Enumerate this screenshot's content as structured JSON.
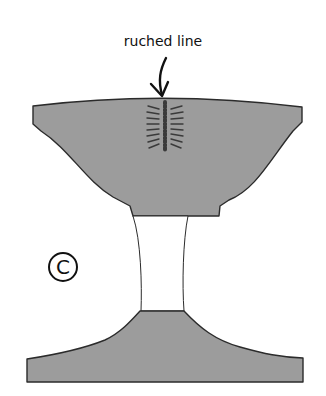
{
  "diagram": {
    "annotation_label": "ruched line",
    "figure_marker": "C",
    "parts": [
      {
        "name": "upper-bodice-piece",
        "fill": "#9c9c9c"
      },
      {
        "name": "waist-panel",
        "fill": "#ffffff"
      },
      {
        "name": "lower-skirt-piece",
        "fill": "#9c9c9c"
      }
    ],
    "colors": {
      "fill": "#9c9c9c",
      "stroke": "#2b2b2b",
      "ruche_line": "#3a3a3a",
      "background": "#ffffff"
    }
  }
}
